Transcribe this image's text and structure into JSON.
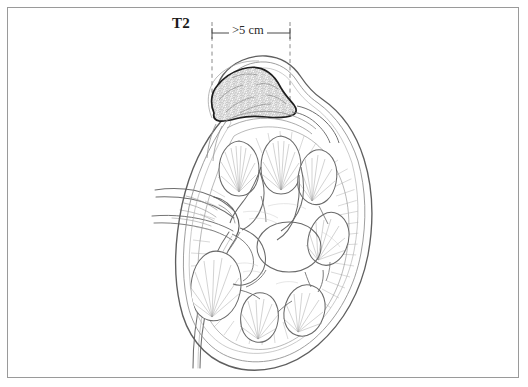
{
  "figure": {
    "background_color": "#ffffff",
    "border_color": "#9a9a9a",
    "line_color": "#6e6e6e",
    "dark_line_color": "#2b2b2b",
    "tumor_outline_color": "#1e1e1e",
    "tumor_fill_color": "#e8e8e8",
    "dash_color": "#8a8a8a"
  },
  "annotations": {
    "stage_label": "T2",
    "measurement_label": ">5 cm"
  },
  "structures": [
    {
      "name": "renal-capsule",
      "label": "Renal capsule"
    },
    {
      "name": "renal-cortex",
      "label": "Renal cortex"
    },
    {
      "name": "renal-pyramid",
      "label": "Renal pyramid"
    },
    {
      "name": "renal-calyx",
      "label": "Renal calyx"
    },
    {
      "name": "renal-pelvis",
      "label": "Renal pelvis"
    },
    {
      "name": "renal-hilum-vessels",
      "label": "Renal vessels"
    },
    {
      "name": "ureter",
      "label": "Ureter"
    },
    {
      "name": "tumor-mass",
      "label": "Tumor mass"
    }
  ]
}
